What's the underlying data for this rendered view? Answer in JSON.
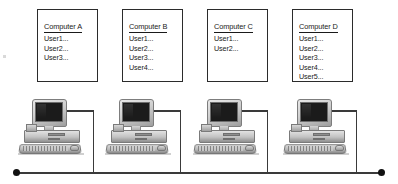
{
  "diagram": {
    "topology": "bus",
    "colors": {
      "line": "#3a3a3a",
      "terminator": "#111111",
      "box_border": "#2b2b2b",
      "text": "#1a1a1a",
      "screen": "#1b1b1b",
      "case": "#c2c2c2"
    },
    "boxes": [
      {
        "id": "computer-a",
        "title": "Computer A",
        "users": [
          "User1...",
          "User2...",
          "User3..."
        ]
      },
      {
        "id": "computer-b",
        "title": "Computer B",
        "users": [
          "User1...",
          "User2...",
          "User3...",
          "User4..."
        ]
      },
      {
        "id": "computer-c",
        "title": "Computer C",
        "users": [
          "User1...",
          "User2..."
        ]
      },
      {
        "id": "computer-d",
        "title": "Computer D",
        "users": [
          "User1...",
          "User2...",
          "User3...",
          "User4...",
          "User5..."
        ]
      }
    ],
    "nodes": [
      {
        "id": "pc-a",
        "label": "Computer A"
      },
      {
        "id": "pc-b",
        "label": "Computer B"
      },
      {
        "id": "pc-c",
        "label": "Computer C"
      },
      {
        "id": "pc-d",
        "label": "Computer D"
      }
    ],
    "bus": {
      "terminator_count": 2,
      "drop_count": 4
    }
  }
}
